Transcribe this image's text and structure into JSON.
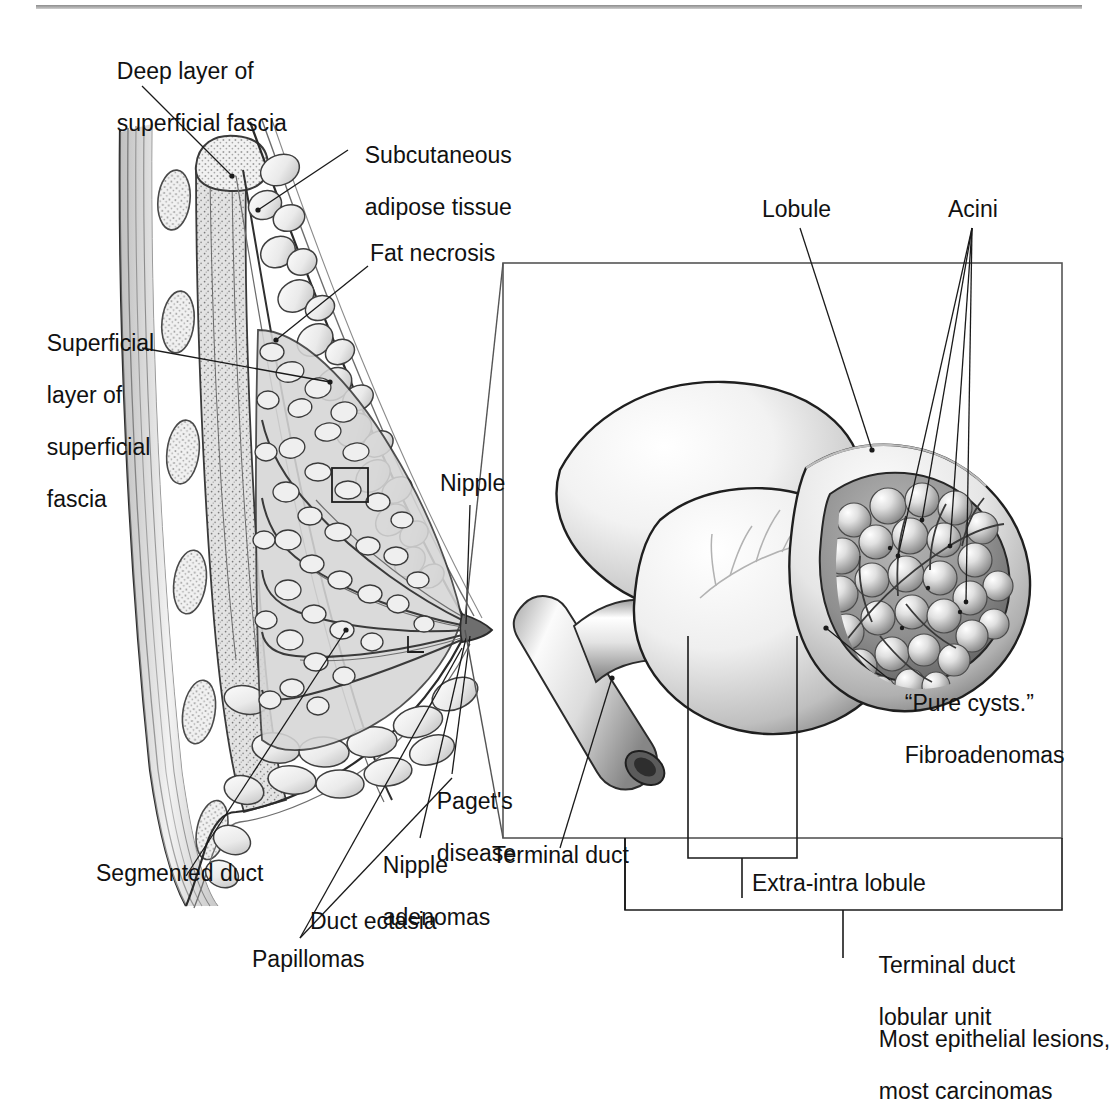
{
  "figure": {
    "title_rule": true,
    "domain": "medical-illustration",
    "colors": {
      "ink": "#111111",
      "leader_line": "#1a1a1a",
      "frame": "#555555",
      "rule": "#9a9a9a",
      "tissue_light": "#e9e9e9",
      "tissue_mid": "#b4b4b4",
      "tissue_dark": "#6d6d6d"
    }
  },
  "labels": {
    "deep_layer": "Deep layer of\nsuperficial fascia",
    "subcutaneous": "Subcutaneous\nadipose tissue",
    "fat_necrosis": "Fat necrosis",
    "superficial_layer": "Superficial\nlayer of\nsuperficial\nfascia",
    "nipple": "Nipple",
    "pagets": "Paget's\ndisease",
    "nipple_adenomas": "Nipple\nadenomas",
    "segmented_duct": "Segmented duct",
    "duct_ectasia": "Duct ectasia",
    "papillomas": "Papillomas",
    "lobule": "Lobule",
    "acini": "Acini",
    "pure_cysts": "“Pure cysts.”\nFibroadenomas",
    "terminal_duct": "Terminal duct",
    "extra_intra_lobule": "Extra-intra lobule",
    "tdlu": "Terminal duct\nlobular unit",
    "most_lesions": "Most epithelial lesions,\nmost carcinomas"
  },
  "labels_flat": {
    "deep_layer_l1": "Deep layer of",
    "deep_layer_l2": "superficial fascia",
    "subcutaneous_l1": "Subcutaneous",
    "subcutaneous_l2": "adipose tissue",
    "fat_necrosis": "Fat necrosis",
    "superficial_l1": "Superficial",
    "superficial_l2": "layer of",
    "superficial_l3": "superficial",
    "superficial_l4": "fascia",
    "nipple": "Nipple",
    "pagets_l1": "Paget's",
    "pagets_l2": "disease",
    "nipple_aden_l1": "Nipple",
    "nipple_aden_l2": "adenomas",
    "segmented_duct": "Segmented duct",
    "duct_ectasia": "Duct ectasia",
    "papillomas": "Papillomas",
    "lobule": "Lobule",
    "acini": "Acini",
    "pure_cysts_l1": "“Pure cysts.”",
    "pure_cysts_l2": "Fibroadenomas",
    "terminal_duct": "Terminal duct",
    "extra_intra_lobule": "Extra-intra lobule",
    "tdlu_l1": "Terminal duct",
    "tdlu_l2": "lobular unit",
    "most_l1": "Most epithelial lesions,",
    "most_l2": "most carcinomas"
  },
  "structures": {
    "left_panel": "breast sagittal cross-section showing chest wall, ribs, pectoral muscle, fascia layers, adipose lobules, glandular ducts and nipple",
    "right_panel": "three-dimensional terminal duct lobular unit with cut-away lobule revealing acini",
    "inset_frame": {
      "x": 503,
      "y": 263,
      "w": 559,
      "h": 575
    }
  }
}
